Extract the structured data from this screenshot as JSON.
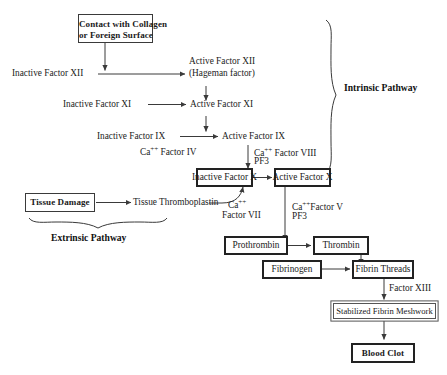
{
  "diagram": {
    "background_color": "#ffffff",
    "line_color": "#3a3a3a"
  },
  "nodes": {
    "contact_collagen_line1": "Contact with Collagen",
    "contact_collagen_line2": "or Foreign Surface",
    "inactive_factor_xii": "Inactive Factor XII",
    "active_factor_xii_line1": "Active Factor XII",
    "active_factor_xii_line2": "(Hageman factor)",
    "inactive_factor_xi": "Inactive Factor XI",
    "active_factor_xi": "Active Factor XI",
    "inactive_factor_ix": "Inactive Factor IX",
    "active_factor_ix": "Active Factor IX",
    "ca_factor_iv": "Ca++ Factor IV",
    "ca_factor_viii": "Ca++ Factor VIII",
    "pf3_upper": "PF3",
    "inactive_factor_x": "Inactive Factor X",
    "active_factor_x": "Active Factor X",
    "tissue_damage": "Tissue Damage",
    "tissue_thromboplastin": "Tissue Thromboplastin",
    "ca_label": "Ca++",
    "factor_vii": "Factor VII",
    "ca_factor_v": "Ca++Factor V",
    "pf3_lower": "PF3",
    "prothrombin": "Prothrombin",
    "thrombin": "Thrombin",
    "fibrinogen": "Fibrinogen",
    "fibrin_threads": "Fibrin Threads",
    "factor_xiii": "Factor XIII",
    "stabilized_fibrin_meshwork": "Stabilized Fibrin Meshwork",
    "blood_clot": "Blood Clot"
  },
  "pathways": {
    "intrinsic": "Intrinsic Pathway",
    "extrinsic": "Extrinsic Pathway"
  }
}
